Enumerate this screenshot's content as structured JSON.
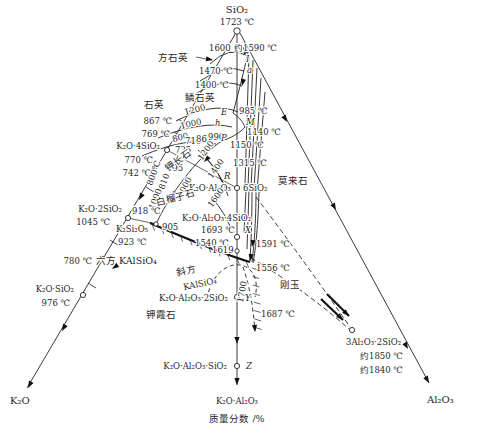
{
  "colors": {
    "ink": "#1f1f1f",
    "background": "#ffffff"
  },
  "labels": [
    {
      "n": "sio2-formula",
      "t": "SiO₂",
      "x": 237,
      "y": 13,
      "a": "m",
      "s": 10
    },
    {
      "n": "sio2-temp",
      "t": "1723 ℃",
      "x": 237,
      "y": 25,
      "a": "m"
    },
    {
      "n": "cristobalite-region",
      "t": "方石英",
      "x": 158,
      "y": 61,
      "s": 9.5
    },
    {
      "n": "iso-1600-upper",
      "t": "1600",
      "x": 209,
      "y": 51
    },
    {
      "n": "temp-approx-1590",
      "t": "约1590 ℃",
      "x": 234,
      "y": 51
    },
    {
      "n": "pt-I",
      "t": "I",
      "x": 246,
      "y": 62,
      "i": 1
    },
    {
      "n": "iso-1470",
      "t": "1470 ℃",
      "x": 199,
      "y": 74
    },
    {
      "n": "pt-a",
      "t": "a",
      "x": 247,
      "y": 73,
      "i": 1
    },
    {
      "n": "iso-1400",
      "t": "1400 ℃",
      "x": 195,
      "y": 88
    },
    {
      "n": "tridymite-region",
      "t": "鳞石英",
      "x": 185,
      "y": 101,
      "s": 9.5
    },
    {
      "n": "quartz-region",
      "t": "石英",
      "x": 144,
      "y": 108,
      "s": 9.5
    },
    {
      "n": "iso-1200-upper",
      "t": "1200",
      "x": 185,
      "y": 115,
      "r": -14
    },
    {
      "n": "temp-867-edge",
      "t": "867 ℃",
      "x": 172,
      "y": 124,
      "a": "e"
    },
    {
      "n": "temp-769",
      "t": "769 ℃",
      "x": 170,
      "y": 137,
      "a": "e"
    },
    {
      "n": "iso-1000-upper",
      "t": "1000",
      "x": 181,
      "y": 129,
      "r": -13
    },
    {
      "n": "iso-800-upper",
      "t": "800",
      "x": 173,
      "y": 142,
      "r": -13
    },
    {
      "n": "k2o-4sio2-formula",
      "t": "K₂O·4SiO₂",
      "x": 160,
      "y": 149,
      "a": "e"
    },
    {
      "n": "temp-770",
      "t": "770 ℃",
      "x": 153,
      "y": 163,
      "a": "e"
    },
    {
      "n": "temp-742",
      "t": "742 ℃",
      "x": 151,
      "y": 176,
      "a": "e"
    },
    {
      "n": "iso-800-rot",
      "t": "800℃",
      "x": 152,
      "y": 186,
      "r": -70
    },
    {
      "n": "iso-810-rot",
      "t": "810",
      "x": 164,
      "y": 190,
      "r": -70
    },
    {
      "n": "iso-1000-rot-a",
      "t": "1000",
      "x": 154,
      "y": 210,
      "r": -68
    },
    {
      "n": "iso-1000-rot-b",
      "t": "1000",
      "x": 182,
      "y": 198,
      "r": -62
    },
    {
      "n": "temp-695",
      "t": "695",
      "x": 167,
      "y": 171
    },
    {
      "n": "temp-725",
      "t": "725",
      "x": 175,
      "y": 153
    },
    {
      "n": "temp-710",
      "t": "710",
      "x": 185,
      "y": 144
    },
    {
      "n": "temp-867-mid",
      "t": "867",
      "x": 196,
      "y": 142
    },
    {
      "n": "temp-990",
      "t": "990",
      "x": 208,
      "y": 140
    },
    {
      "n": "pt-h",
      "t": "h",
      "x": 215,
      "y": 126,
      "i": 1
    },
    {
      "n": "pt-E",
      "t": "E",
      "x": 221,
      "y": 115,
      "i": 1
    },
    {
      "n": "temp-985",
      "t": "985 ℃",
      "x": 239,
      "y": 114
    },
    {
      "n": "pt-M",
      "t": "M",
      "x": 246,
      "y": 125,
      "i": 1
    },
    {
      "n": "temp-1140",
      "t": "1140 ℃",
      "x": 247,
      "y": 135
    },
    {
      "n": "temp-1150",
      "t": "1150 ℃",
      "x": 230,
      "y": 148
    },
    {
      "n": "pt-P",
      "t": "P",
      "x": 221,
      "y": 141,
      "i": 1
    },
    {
      "n": "kfeldspar-region",
      "t": "钾长石",
      "x": 168,
      "y": 172,
      "r": -36,
      "s": 9.5
    },
    {
      "n": "iso-1200-leucite",
      "t": "1200",
      "x": 202,
      "y": 161,
      "r": -55
    },
    {
      "n": "iso-1400-leucite",
      "t": "1400",
      "x": 212,
      "y": 179,
      "r": -55
    },
    {
      "n": "temp-1315",
      "t": "1315 ℃",
      "x": 233,
      "y": 166
    },
    {
      "n": "pt-R",
      "t": "R",
      "x": 224,
      "y": 179,
      "i": 1
    },
    {
      "n": "mullite-region",
      "t": "莫来石",
      "x": 278,
      "y": 184,
      "s": 9.5
    },
    {
      "n": "feldspar-formula-left",
      "t": "K₂O·Al₂O₃",
      "x": 231,
      "y": 191,
      "a": "e"
    },
    {
      "n": "feldspar-formula-right",
      "t": "6SiO₂",
      "x": 243,
      "y": 191
    },
    {
      "n": "leucite-region",
      "t": "白榴子石",
      "x": 157,
      "y": 206,
      "r": -15,
      "s": 9.5
    },
    {
      "n": "iso-1600-leucite",
      "t": "1600",
      "x": 212,
      "y": 208,
      "r": -55
    },
    {
      "n": "leucite-formula",
      "t": "K₂O·Al₂O₃·4SiO₂",
      "x": 182,
      "y": 221
    },
    {
      "n": "temp-1693",
      "t": "1693 ℃",
      "x": 201,
      "y": 233
    },
    {
      "n": "pt-X",
      "t": "X",
      "x": 245,
      "y": 233,
      "i": 1
    },
    {
      "n": "temp-1540",
      "t": "1540 ℃",
      "x": 195,
      "y": 246
    },
    {
      "n": "temp-1619",
      "t": "1619",
      "x": 212,
      "y": 253
    },
    {
      "n": "temp-1591",
      "t": "1591 ℃",
      "x": 256,
      "y": 247
    },
    {
      "n": "temp-1556",
      "t": "1556 ℃",
      "x": 256,
      "y": 271
    },
    {
      "n": "k2o-2sio2-formula",
      "t": "K₂O·2SiO₂",
      "x": 122,
      "y": 212,
      "a": "e"
    },
    {
      "n": "temp-1045",
      "t": "1045 ℃",
      "x": 110,
      "y": 225,
      "a": "e"
    },
    {
      "n": "temp-918",
      "t": "918 ℃",
      "x": 132,
      "y": 214
    },
    {
      "n": "k2si2o5-formula",
      "t": "K₂Si₂O₅",
      "x": 116,
      "y": 232
    },
    {
      "n": "temp-905",
      "t": "905",
      "x": 162,
      "y": 230
    },
    {
      "n": "temp-923",
      "t": "923 ℃",
      "x": 118,
      "y": 245
    },
    {
      "n": "temp-780",
      "t": "780 ℃",
      "x": 92,
      "y": 264,
      "a": "e"
    },
    {
      "n": "k2o-sio2-formula",
      "t": "K₂O·SiO₂",
      "x": 74,
      "y": 292,
      "a": "e"
    },
    {
      "n": "temp-976",
      "t": "976 ℃",
      "x": 70,
      "y": 306,
      "a": "e"
    },
    {
      "n": "k2o-vertex",
      "t": "K₂O",
      "x": 10,
      "y": 404,
      "s": 10
    },
    {
      "n": "hex-kalsilite-label",
      "t": "六方 KAlSiO₄",
      "x": 96,
      "y": 264,
      "s": 9.5
    },
    {
      "n": "ortho-label",
      "t": "斜方",
      "x": 177,
      "y": 276,
      "r": -12,
      "s": 9.5
    },
    {
      "n": "ortho-kalsilite-label",
      "t": "KAlSiO₄",
      "x": 184,
      "y": 290,
      "r": -12
    },
    {
      "n": "kaliophilite-formula",
      "t": "K₂O·Al₂O₃·2SiO₂",
      "x": 228,
      "y": 301,
      "a": "e"
    },
    {
      "n": "pt-Y",
      "t": "Y",
      "x": 245,
      "y": 301,
      "i": 1
    },
    {
      "n": "kaliophilite-region",
      "t": "钾霞石",
      "x": 146,
      "y": 318,
      "s": 9.5
    },
    {
      "n": "iso-1700-rot",
      "t": "1700",
      "x": 243,
      "y": 303,
      "r": -80
    },
    {
      "n": "temp-1687",
      "t": "1687 ℃",
      "x": 261,
      "y": 317
    },
    {
      "n": "corundum-region",
      "t": "刚玉",
      "x": 280,
      "y": 288,
      "s": 9.5
    },
    {
      "n": "kas-formula",
      "t": "K₂O·Al₂O₃·SiO₂",
      "x": 227,
      "y": 369,
      "a": "e"
    },
    {
      "n": "pt-Z",
      "t": "Z",
      "x": 246,
      "y": 369,
      "i": 1
    },
    {
      "n": "k2o-al2o3-join",
      "t": "K₂O·Al₂O₃",
      "x": 237,
      "y": 404,
      "a": "m"
    },
    {
      "n": "mass-fraction-caption",
      "t": "质量分数 /%",
      "x": 237,
      "y": 422,
      "a": "m",
      "s": 9.5
    },
    {
      "n": "mullite-formula",
      "t": "3Al₂O₃·2SiO₂",
      "x": 346,
      "y": 345
    },
    {
      "n": "temp-approx-1850",
      "t": "约1850 ℃",
      "x": 360,
      "y": 359
    },
    {
      "n": "temp-approx-1840",
      "t": "约1840 ℃",
      "x": 360,
      "y": 373
    },
    {
      "n": "al2o3-vertex",
      "t": "Al₂O₃",
      "x": 427,
      "y": 403,
      "s": 10
    }
  ]
}
